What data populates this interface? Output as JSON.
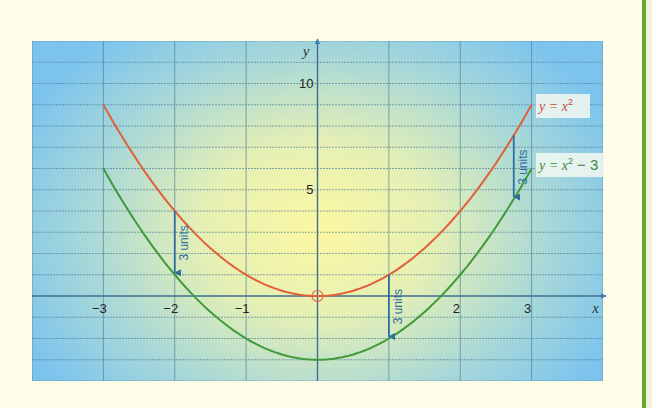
{
  "chart_data": {
    "type": "line",
    "title": "",
    "xlabel": "x",
    "ylabel": "y",
    "xlim": [
      -4,
      4
    ],
    "ylim": [
      -4,
      12
    ],
    "grid": true,
    "x_ticks": [
      {
        "value": -3,
        "label": "−3"
      },
      {
        "value": -2,
        "label": "−2"
      },
      {
        "value": -1,
        "label": "−1"
      },
      {
        "value": 2,
        "label": "2"
      },
      {
        "value": 3,
        "label": "3"
      }
    ],
    "y_ticks": [
      {
        "value": 5,
        "label": "5"
      },
      {
        "value": 10,
        "label": "10"
      }
    ],
    "series": [
      {
        "name": "y = x²",
        "formula": "x^2",
        "color": "#e06038",
        "x": [
          -3,
          -2,
          -1,
          0,
          1,
          2,
          3
        ],
        "values": [
          9,
          4,
          1,
          0,
          1,
          4,
          9
        ]
      },
      {
        "name": "y = x² − 3",
        "formula": "x^2-3",
        "color": "#3f9a3a",
        "x": [
          -3,
          -2,
          -1,
          0,
          1,
          2,
          3
        ],
        "values": [
          6,
          1,
          -2,
          -3,
          -2,
          1,
          6
        ]
      }
    ],
    "annotations": [
      {
        "type": "arrow",
        "x": -2,
        "from_y": 4,
        "to_y": 1,
        "label": "3 units"
      },
      {
        "type": "arrow",
        "x": 1,
        "from_y": 1,
        "to_y": -2,
        "label": "3 units"
      },
      {
        "type": "arrow",
        "x": 2.75,
        "from_y": 7.5625,
        "to_y": 4.5625,
        "label": "3 units"
      },
      {
        "type": "point",
        "x": 0,
        "y": 0,
        "marker": "open-circle"
      }
    ],
    "legend": [
      {
        "label_prefix": "y = x",
        "sup": "2",
        "suffix": "",
        "color": "#c4503a"
      },
      {
        "label_prefix": "y = x",
        "sup": "2",
        "suffix": " − 3",
        "color": "#3a8a3a"
      }
    ]
  },
  "axis_labels": {
    "x": "x",
    "y": "y"
  },
  "shift_label": "3 units",
  "colors": {
    "red_curve": "#e06038",
    "green_curve": "#3f9a3a",
    "arrow": "#2f6fa0",
    "axis": "#3f6f8f",
    "grid": "#4d7f96",
    "bg_center": "#fbf7a6",
    "bg_edge": "#7cc4ee"
  }
}
